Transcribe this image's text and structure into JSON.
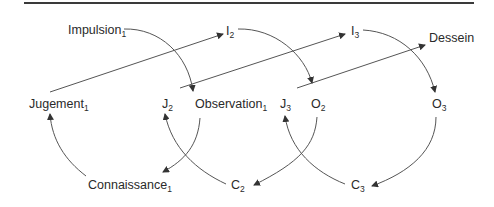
{
  "diagram": {
    "type": "cycle-flow",
    "line_color": "#555555",
    "text_color": "#2a2a2a",
    "nodes": [
      {
        "id": "impulsion1",
        "base": "Impulsion",
        "sub": "1",
        "x": 68,
        "y": 24
      },
      {
        "id": "i2",
        "base": "I",
        "sub": "2",
        "x": 226,
        "y": 25
      },
      {
        "id": "i3",
        "base": "I",
        "sub": "3",
        "x": 351,
        "y": 25
      },
      {
        "id": "dessein",
        "base": "Dessein",
        "sub": "",
        "x": 399,
        "y": 32
      },
      {
        "id": "jugement1",
        "base": "Jugement",
        "sub": "1",
        "x": 29,
        "y": 98
      },
      {
        "id": "j2",
        "base": "J",
        "sub": "2",
        "x": 164,
        "y": 98
      },
      {
        "id": "observation1",
        "base": "Observation",
        "sub": "1",
        "x": 195,
        "y": 98
      },
      {
        "id": "j3",
        "base": "J",
        "sub": "3",
        "x": 280,
        "y": 98
      },
      {
        "id": "o2",
        "base": "O",
        "sub": "2",
        "x": 311,
        "y": 98
      },
      {
        "id": "o3",
        "base": "O",
        "sub": "3",
        "x": 432,
        "y": 98
      },
      {
        "id": "connaissance1",
        "base": "Connaissance",
        "sub": "1",
        "x": 88,
        "y": 179
      },
      {
        "id": "c2",
        "base": "C",
        "sub": "2",
        "x": 231,
        "y": 179
      },
      {
        "id": "c3",
        "base": "C",
        "sub": "3",
        "x": 351,
        "y": 179
      }
    ],
    "edges": [
      {
        "from": "jugement1",
        "to": "i2",
        "kind": "straight"
      },
      {
        "from": "j2",
        "to": "i3",
        "kind": "straight"
      },
      {
        "from": "j3",
        "to": "dessein",
        "kind": "straight"
      },
      {
        "from": "impulsion1",
        "to": "observation1",
        "kind": "curve"
      },
      {
        "from": "i2",
        "to": "o2",
        "kind": "curve"
      },
      {
        "from": "i3",
        "to": "o3",
        "kind": "curve"
      },
      {
        "from": "observation1",
        "to": "connaissance1",
        "kind": "curve"
      },
      {
        "from": "o2",
        "to": "c2",
        "kind": "curve"
      },
      {
        "from": "o3",
        "to": "c3",
        "kind": "curve"
      },
      {
        "from": "connaissance1",
        "to": "jugement1",
        "kind": "curve"
      },
      {
        "from": "c2",
        "to": "j2",
        "kind": "curve"
      },
      {
        "from": "c3",
        "to": "j3",
        "kind": "curve"
      }
    ]
  }
}
